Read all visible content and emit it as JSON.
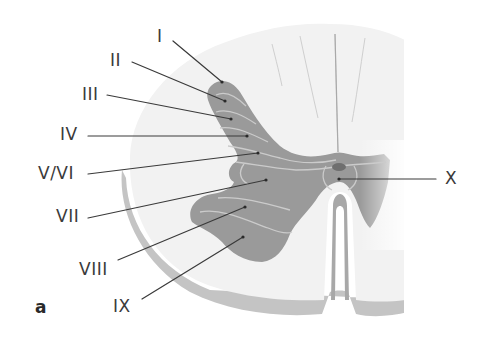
{
  "figure": {
    "panel_letter": "a",
    "colors": {
      "white_matter": "#f1f1f1",
      "white_matter_rim": "#c4c4c4",
      "grey_matter": "#9a9a9a",
      "lamina_boundary": "#c9c9c9",
      "leader_line": "#3a3a3a",
      "label_text": "#3a3a3a",
      "central_canal": "#6f6f6f"
    },
    "labels": [
      {
        "id": "I",
        "text": "I",
        "x": 157,
        "y": 30
      },
      {
        "id": "II",
        "text": "II",
        "x": 110,
        "y": 53
      },
      {
        "id": "III",
        "text": "III",
        "x": 82,
        "y": 87
      },
      {
        "id": "IV",
        "text": "IV",
        "x": 60,
        "y": 126
      },
      {
        "id": "V/VI",
        "text": "V/VI",
        "x": 38,
        "y": 166
      },
      {
        "id": "VII",
        "text": "VII",
        "x": 56,
        "y": 210
      },
      {
        "id": "VIII",
        "text": "VIII",
        "x": 79,
        "y": 262
      },
      {
        "id": "IX",
        "text": "IX",
        "x": 113,
        "y": 299
      },
      {
        "id": "X",
        "text": "X",
        "x": 445,
        "y": 171
      }
    ]
  }
}
